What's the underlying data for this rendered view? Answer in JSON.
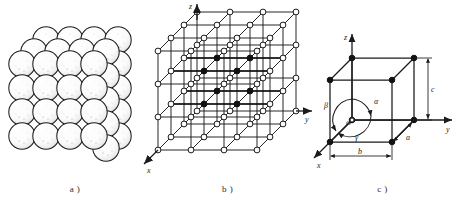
{
  "figure": {
    "panels": [
      {
        "id": "a",
        "caption": "a )",
        "name": "hard-sphere-packing-model",
        "description": "Close-packed hard sphere model of a crystal",
        "sphere_rows": 4,
        "sphere_cols": 5,
        "depth_layers": 2,
        "sphere_fill": "#ffffff",
        "sphere_stroke": "#1b1b1b"
      },
      {
        "id": "b",
        "caption": "b )",
        "name": "space-lattice-model",
        "description": "Space lattice of 4 x 4 x 4 lattice points with a highlighted diagonal plane",
        "nodes_per_edge": 4,
        "axes": [
          {
            "label": "z",
            "name": "z-axis"
          },
          {
            "label": "y",
            "name": "y-axis"
          },
          {
            "label": "x",
            "name": "x-axis"
          }
        ],
        "open_node_fill": "#ffffff",
        "filled_node_fill": "#111111",
        "line_color": "#1b1b1b"
      },
      {
        "id": "c",
        "caption": "c )",
        "name": "unit-cell-model",
        "description": "Unit cell with lattice parameters and interaxial angles",
        "axes": [
          {
            "label": "z",
            "name": "z-axis"
          },
          {
            "label": "y",
            "name": "y-axis"
          },
          {
            "label": "x",
            "name": "x-axis"
          }
        ],
        "origin_label": "O",
        "edge_lengths": [
          {
            "label": "a",
            "name": "edge-length-a"
          },
          {
            "label": "b",
            "name": "edge-length-b"
          },
          {
            "label": "c",
            "name": "edge-length-c"
          }
        ],
        "angles": [
          {
            "label": "α",
            "name": "angle-alpha"
          },
          {
            "label": "β",
            "name": "angle-beta"
          },
          {
            "label": "γ",
            "name": "angle-gamma"
          }
        ],
        "vertex_fill": "#111111",
        "line_color": "#1b1b1b"
      }
    ]
  }
}
